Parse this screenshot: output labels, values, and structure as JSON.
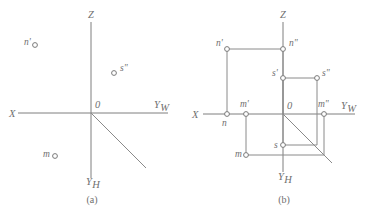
{
  "figure": {
    "background_color": "#ffffff",
    "line_color": "#8a8a8a",
    "text_color": "#6f6f6f"
  },
  "panels": [
    {
      "id": "a",
      "caption": "(a)",
      "axes": {
        "x_label": "X",
        "z_label": "Z",
        "yw_label": "Y",
        "yw_sub": "W",
        "yh_label": "Y",
        "yh_sub": "H",
        "origin_label": "0"
      },
      "points": [
        {
          "name": "n-prime",
          "label": "n'",
          "label_side": "left"
        },
        {
          "name": "s-double-prime",
          "label": "s\"",
          "label_side": "right"
        },
        {
          "name": "m-plain",
          "label": "m",
          "label_side": "left"
        }
      ]
    },
    {
      "id": "b",
      "caption": "(b)",
      "axes": {
        "x_label": "X",
        "z_label": "Z",
        "yw_label": "Y",
        "yw_sub": "W",
        "yh_label": "Y",
        "yh_sub": "H",
        "origin_label": "0"
      },
      "points": [
        {
          "name": "n-prime",
          "label": "n'",
          "label_side": "left"
        },
        {
          "name": "n-double-prime",
          "label": "n\"",
          "label_side": "right"
        },
        {
          "name": "s-prime",
          "label": "s'",
          "label_side": "left"
        },
        {
          "name": "s-double-prime",
          "label": "s\"",
          "label_side": "right"
        },
        {
          "name": "m-prime",
          "label": "m'",
          "label_side": "above"
        },
        {
          "name": "m-double-prime",
          "label": "m\"",
          "label_side": "above"
        },
        {
          "name": "n-plain",
          "label": "n",
          "label_side": "below"
        },
        {
          "name": "s-plain",
          "label": "s",
          "label_side": "left"
        },
        {
          "name": "m-plain",
          "label": "m",
          "label_side": "left"
        }
      ]
    }
  ],
  "chart_data": {
    "type": "scatter",
    "xlabel": "",
    "ylabel": "",
    "grid": false,
    "legend": null,
    "subplots": [
      {
        "id": "a",
        "caption": "(a)",
        "origin_px": [
          91,
          113
        ],
        "axis_segments": [
          {
            "name": "x-axis",
            "x1": 18,
            "y1": 113,
            "x2": 91,
            "y2": 113
          },
          {
            "name": "yw-axis",
            "x1": 91,
            "y1": 113,
            "x2": 168,
            "y2": 113
          },
          {
            "name": "z-axis",
            "x1": 91,
            "y1": 22,
            "x2": 91,
            "y2": 113
          },
          {
            "name": "yh-axis",
            "x1": 91,
            "y1": 113,
            "x2": 91,
            "y2": 178
          },
          {
            "name": "yh-diagonal",
            "x1": 91,
            "y1": 113,
            "x2": 146,
            "y2": 168
          }
        ],
        "axis_labels": [
          {
            "text": "X",
            "x": 9,
            "y": 117
          },
          {
            "text": "Z",
            "x": 88,
            "y": 18
          },
          {
            "text": "Y",
            "x": 154,
            "y": 108,
            "sub": "W"
          },
          {
            "text": "Y",
            "x": 86,
            "y": 185,
            "sub": "H"
          },
          {
            "text": "0",
            "x": 95,
            "y": 108
          }
        ],
        "points": [
          {
            "label": "n'",
            "x": 35,
            "y": 45,
            "lx": 24,
            "ly": 45
          },
          {
            "label": "s\"",
            "x": 114,
            "y": 73,
            "lx": 120,
            "ly": 71
          },
          {
            "label": "m",
            "x": 55,
            "y": 156,
            "lx": 43,
            "ly": 157
          }
        ]
      },
      {
        "id": "b",
        "caption": "(b)",
        "origin_px": [
          283,
          114
        ],
        "axis_segments": [
          {
            "name": "x-axis",
            "x1": 203,
            "y1": 114,
            "x2": 283,
            "y2": 114
          },
          {
            "name": "yw-axis",
            "x1": 283,
            "y1": 114,
            "x2": 355,
            "y2": 114
          },
          {
            "name": "z-axis",
            "x1": 283,
            "y1": 22,
            "x2": 283,
            "y2": 114
          },
          {
            "name": "yh-axis",
            "x1": 283,
            "y1": 114,
            "x2": 283,
            "y2": 172
          },
          {
            "name": "yh-diagonal",
            "x1": 283,
            "y1": 114,
            "x2": 332,
            "y2": 163
          }
        ],
        "axis_labels": [
          {
            "text": "X",
            "x": 192,
            "y": 118
          },
          {
            "text": "Z",
            "x": 280,
            "y": 18
          },
          {
            "text": "Y",
            "x": 341,
            "y": 109,
            "sub": "W"
          },
          {
            "text": "Y",
            "x": 278,
            "y": 180,
            "sub": "H"
          },
          {
            "text": "0",
            "x": 287,
            "y": 109
          }
        ],
        "points": [
          {
            "label": "n'",
            "x": 227,
            "y": 49,
            "lx": 216,
            "ly": 46
          },
          {
            "label": "n\"",
            "x": 283,
            "y": 49,
            "lx": 289,
            "ly": 46
          },
          {
            "label": "s'",
            "x": 283,
            "y": 78,
            "lx": 272,
            "ly": 76
          },
          {
            "label": "s\"",
            "x": 317,
            "y": 78,
            "lx": 322,
            "ly": 76
          },
          {
            "label": "m'",
            "x": 246,
            "y": 114,
            "lx": 240,
            "ly": 107
          },
          {
            "label": "m\"",
            "x": 324,
            "y": 114,
            "lx": 318,
            "ly": 107
          },
          {
            "label": "n",
            "x": 227,
            "y": 114,
            "lx": 222,
            "ly": 126
          },
          {
            "label": "s",
            "x": 283,
            "y": 145,
            "lx": 274,
            "ly": 148
          },
          {
            "label": "m",
            "x": 246,
            "y": 155,
            "lx": 235,
            "ly": 157
          }
        ],
        "connector_lines": [
          {
            "name": "n-prime-to-n-double-prime",
            "x1": 227,
            "y1": 49,
            "x2": 283,
            "y2": 49
          },
          {
            "name": "n-prime-to-n",
            "x1": 227,
            "y1": 49,
            "x2": 227,
            "y2": 114
          },
          {
            "name": "n-double-prime-vertical",
            "x1": 283,
            "y1": 49,
            "x2": 283,
            "y2": 114
          },
          {
            "name": "s-prime-to-s-double-prime",
            "x1": 283,
            "y1": 78,
            "x2": 317,
            "y2": 78
          },
          {
            "name": "s-double-prime-vertical",
            "x1": 317,
            "y1": 78,
            "x2": 317,
            "y2": 145
          },
          {
            "name": "s-to-s-prime-vertical",
            "x1": 283,
            "y1": 78,
            "x2": 283,
            "y2": 145
          },
          {
            "name": "s-to-diagonal",
            "x1": 283,
            "y1": 145,
            "x2": 317,
            "y2": 145
          },
          {
            "name": "m-prime-to-m",
            "x1": 246,
            "y1": 114,
            "x2": 246,
            "y2": 155
          },
          {
            "name": "m-to-m-double-prime-row",
            "x1": 246,
            "y1": 155,
            "x2": 324,
            "y2": 155
          },
          {
            "name": "m-double-prime-vertical",
            "x1": 324,
            "y1": 114,
            "x2": 324,
            "y2": 155
          }
        ]
      }
    ]
  }
}
